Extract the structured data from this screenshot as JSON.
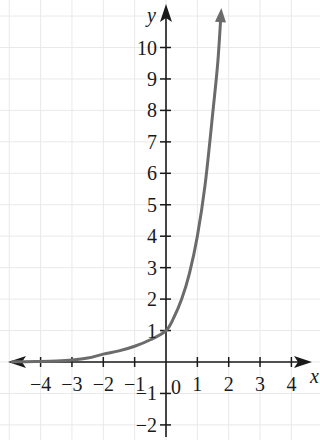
{
  "chart_data": {
    "type": "line",
    "title": "",
    "subtitle": "",
    "xlabel": "x",
    "ylabel": "y",
    "xlim": [
      -4.9,
      4.6
    ],
    "ylim": [
      -2.6,
      11.2
    ],
    "grid": true,
    "legend": false,
    "function": "y = 4^x",
    "series": [
      {
        "name": "exponential curve",
        "color": "#6b6b6b",
        "points": [
          {
            "x": -4.9,
            "y": 0.004
          },
          {
            "x": -4.5,
            "y": 0.008
          },
          {
            "x": -4.0,
            "y": 0.0156
          },
          {
            "x": -3.5,
            "y": 0.031
          },
          {
            "x": -3.0,
            "y": 0.0625
          },
          {
            "x": -2.5,
            "y": 0.125
          },
          {
            "x": -2.0,
            "y": 0.25
          },
          {
            "x": -1.5,
            "y": 0.354
          },
          {
            "x": -1.0,
            "y": 0.5
          },
          {
            "x": -0.5,
            "y": 0.707
          },
          {
            "x": 0.0,
            "y": 1.0
          },
          {
            "x": 0.25,
            "y": 1.414
          },
          {
            "x": 0.5,
            "y": 2.0
          },
          {
            "x": 0.75,
            "y": 2.828
          },
          {
            "x": 1.0,
            "y": 4.0
          },
          {
            "x": 1.25,
            "y": 5.657
          },
          {
            "x": 1.5,
            "y": 8.0
          },
          {
            "x": 1.65,
            "y": 9.5
          },
          {
            "x": 1.75,
            "y": 11.0
          }
        ]
      }
    ],
    "x_ticks": [
      {
        "value": -4,
        "label": "−4"
      },
      {
        "value": -3,
        "label": "−3"
      },
      {
        "value": -2,
        "label": "−2"
      },
      {
        "value": -1,
        "label": "−1"
      },
      {
        "value": 1,
        "label": "1"
      },
      {
        "value": 2,
        "label": "2"
      },
      {
        "value": 3,
        "label": "3"
      },
      {
        "value": 4,
        "label": "4"
      }
    ],
    "y_ticks": [
      {
        "value": 10,
        "label": "10"
      },
      {
        "value": 9,
        "label": "9"
      },
      {
        "value": 8,
        "label": "8"
      },
      {
        "value": 7,
        "label": "7"
      },
      {
        "value": 6,
        "label": "6"
      },
      {
        "value": 5,
        "label": "5"
      },
      {
        "value": 4,
        "label": "4"
      },
      {
        "value": 3,
        "label": "3"
      },
      {
        "value": 2,
        "label": "2"
      },
      {
        "value": 1,
        "label": "1"
      },
      {
        "value": -1,
        "label": "−1"
      },
      {
        "value": -2,
        "label": "−2"
      }
    ],
    "origin_label": "0",
    "colors": {
      "curve": "#6b6b6b",
      "axis": "#1a1a1a",
      "grid": "#e9e9e9",
      "label": "#1a1a1a",
      "background": "#ffffff"
    }
  }
}
